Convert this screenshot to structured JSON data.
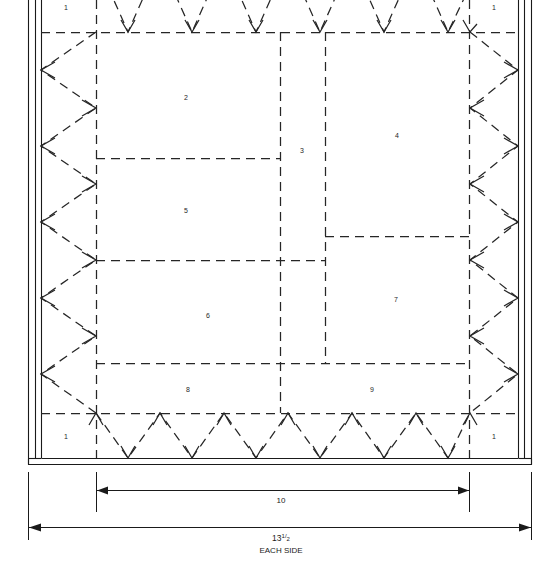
{
  "diagram": {
    "type": "framing-plan",
    "colors": {
      "line": "#1a1a1a",
      "dashed": "#333333",
      "background": "#ffffff",
      "text": "#262626"
    },
    "region_labels": [
      {
        "id": "1",
        "text": "1",
        "x": 66,
        "y": 8,
        "name": "region-label-1-top-left"
      },
      {
        "id": "1",
        "text": "1",
        "x": 494,
        "y": 8,
        "name": "region-label-1-top-right"
      },
      {
        "id": "2",
        "text": "2",
        "x": 186,
        "y": 98,
        "name": "region-label-2"
      },
      {
        "id": "3",
        "text": "3",
        "x": 302,
        "y": 151,
        "name": "region-label-3"
      },
      {
        "id": "4",
        "text": "4",
        "x": 397,
        "y": 136,
        "name": "region-label-4"
      },
      {
        "id": "5",
        "text": "5",
        "x": 186,
        "y": 211,
        "name": "region-label-5"
      },
      {
        "id": "6",
        "text": "6",
        "x": 208,
        "y": 316,
        "name": "region-label-6"
      },
      {
        "id": "7",
        "text": "7",
        "x": 396,
        "y": 300,
        "name": "region-label-7"
      },
      {
        "id": "8",
        "text": "8",
        "x": 188,
        "y": 390,
        "name": "region-label-8"
      },
      {
        "id": "9",
        "text": "9",
        "x": 372,
        "y": 390,
        "name": "region-label-9"
      },
      {
        "id": "1",
        "text": "1",
        "x": 66,
        "y": 437,
        "name": "region-label-1-bottom-left"
      },
      {
        "id": "1",
        "text": "1",
        "x": 494,
        "y": 437,
        "name": "region-label-1-bottom-right"
      }
    ],
    "dimensions": [
      {
        "name": "dimension-10",
        "label": "10",
        "label_x": 281,
        "label_y": 502,
        "line_y": 490,
        "x_start": 96,
        "x_end": 469,
        "ext_top": 472,
        "ext_bottom": 512
      },
      {
        "name": "dimension-13-1-2-each-side",
        "label": "13",
        "fraction_numerator": "1",
        "fraction_denominator": "2",
        "sublabel": "EACH SIDE",
        "label_x": 281,
        "label_y": 537,
        "sublabel_y": 550,
        "line_y": 527,
        "x_start": 28,
        "x_end": 531,
        "ext_top": 472,
        "ext_bottom": 540
      }
    ],
    "frame": {
      "outer_left": 28,
      "outer_right": 531,
      "outer_top": -6,
      "outer_bottom": 465,
      "wall_thickness": 7,
      "inner_left": 41,
      "inner_right": 518,
      "inner_bottom": 458
    },
    "inner_rect": {
      "left": 96,
      "right": 469,
      "top": 32,
      "bottom": 413
    },
    "partitions": {
      "v_lines": [
        {
          "x": 280,
          "y1": 32,
          "y2": 413,
          "name": "partition-vertical-mid-left"
        },
        {
          "x": 325,
          "y1": 32,
          "y2": 363,
          "name": "partition-vertical-mid-right"
        }
      ],
      "h_lines": [
        {
          "y": 158,
          "x1": 96,
          "x2": 280,
          "name": "partition-horizontal-2-5"
        },
        {
          "y": 260,
          "x1": 96,
          "x2": 280,
          "name": "partition-horizontal-5-6"
        },
        {
          "y": 236,
          "x1": 325,
          "x2": 469,
          "name": "partition-horizontal-4-7"
        },
        {
          "y": 363,
          "x1": 96,
          "x2": 469,
          "name": "partition-horizontal-bottom-row"
        }
      ]
    },
    "zigzag": {
      "top": {
        "count": 6,
        "direction": "down",
        "name": "joist-bracing-top"
      },
      "bottom": {
        "count": 6,
        "direction": "down",
        "name": "joist-bracing-bottom"
      },
      "left": {
        "count": 5,
        "direction": "left",
        "name": "joist-bracing-left"
      },
      "right": {
        "count": 5,
        "direction": "right",
        "name": "joist-bracing-right"
      }
    }
  }
}
